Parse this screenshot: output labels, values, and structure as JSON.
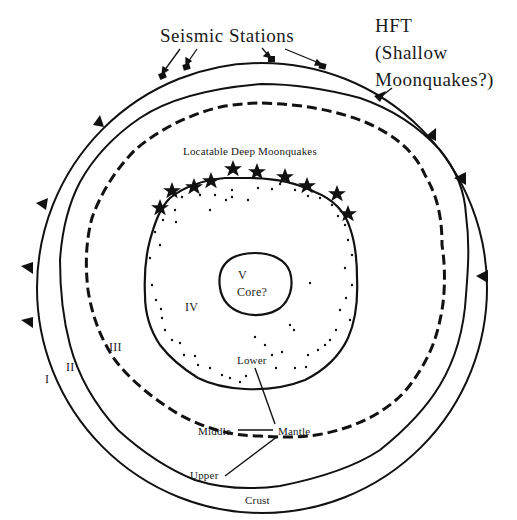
{
  "diagram": {
    "title_labels": {
      "seismic_stations": "Seismic Stations",
      "hft_line1": "HFT",
      "hft_line2": "(Shallow",
      "hft_line3": "Moonquakes?)",
      "deep_moonquakes": "Locatable Deep Moonquakes"
    },
    "zones": {
      "I": "I",
      "II": "II",
      "III": "III",
      "IV": "IV",
      "V": "V",
      "core": "Core?"
    },
    "layer_labels": {
      "lower": "Lower",
      "middle": "Middle",
      "mantle": "Mantle",
      "upper": "Upper",
      "crust": "Crust"
    },
    "colors": {
      "ink": "#111111",
      "background": "#ffffff"
    }
  }
}
